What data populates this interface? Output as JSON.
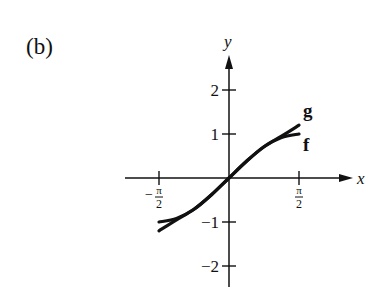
{
  "panel_label": "(b)",
  "chart_data": {
    "type": "line",
    "title": "",
    "xlabel": "x",
    "ylabel": "y",
    "xlim": [
      -1.5708,
      1.5708
    ],
    "ylim": [
      -2.5,
      2.5
    ],
    "grid": false,
    "legend": "inline curve labels at right end",
    "x_ticks": [
      {
        "value": -1.5708,
        "label_num": "π",
        "label_den": "2",
        "sign": "−"
      },
      {
        "value": 1.5708,
        "label_num": "π",
        "label_den": "2",
        "sign": ""
      }
    ],
    "y_ticks": [
      {
        "value": 2,
        "label": "2"
      },
      {
        "value": 1,
        "label": "1"
      },
      {
        "value": -1,
        "label": "−1"
      },
      {
        "value": -2,
        "label": "−2"
      }
    ],
    "series": [
      {
        "name": "f",
        "label": "f",
        "x": [
          -1.5708,
          -1.1781,
          -0.7854,
          -0.3927,
          0,
          0.3927,
          0.7854,
          1.1781,
          1.5708
        ],
        "values": [
          -1.0,
          -0.92,
          -0.71,
          -0.38,
          0,
          0.38,
          0.71,
          0.92,
          1.0
        ]
      },
      {
        "name": "g",
        "label": "g",
        "x": [
          -1.5708,
          -1.1781,
          -0.7854,
          -0.3927,
          0,
          0.3927,
          0.7854,
          1.1781,
          1.5708
        ],
        "values": [
          -1.2,
          -0.95,
          -0.71,
          -0.38,
          0,
          0.38,
          0.71,
          0.95,
          1.2
        ]
      }
    ]
  }
}
